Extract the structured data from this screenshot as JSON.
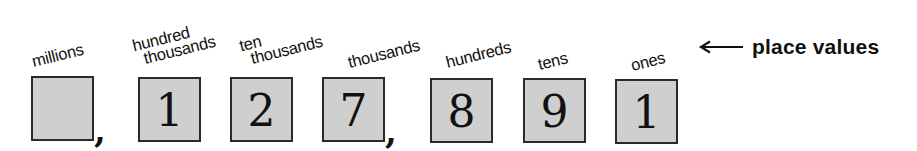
{
  "diagram": {
    "number": "1,27,891",
    "legend": {
      "arrow_icon": "left-arrow-icon",
      "label": "place values"
    },
    "places": [
      {
        "label_line1": "millions",
        "label_line2": "",
        "digit": ""
      },
      {
        "label_line1": "hundred",
        "label_line2": "thousands",
        "digit": "1"
      },
      {
        "label_line1": "ten",
        "label_line2": "thousands",
        "digit": "2"
      },
      {
        "label_line1": "thousands",
        "label_line2": "",
        "digit": "7"
      },
      {
        "label_line1": "hundreds",
        "label_line2": "",
        "digit": "8"
      },
      {
        "label_line1": "tens",
        "label_line2": "",
        "digit": "9"
      },
      {
        "label_line1": "ones",
        "label_line2": "",
        "digit": "1"
      }
    ],
    "separators": [
      ",",
      ","
    ],
    "colors": {
      "box_fill": "#cfcfcf",
      "box_border": "#2a2a2a",
      "text": "#111111"
    }
  }
}
